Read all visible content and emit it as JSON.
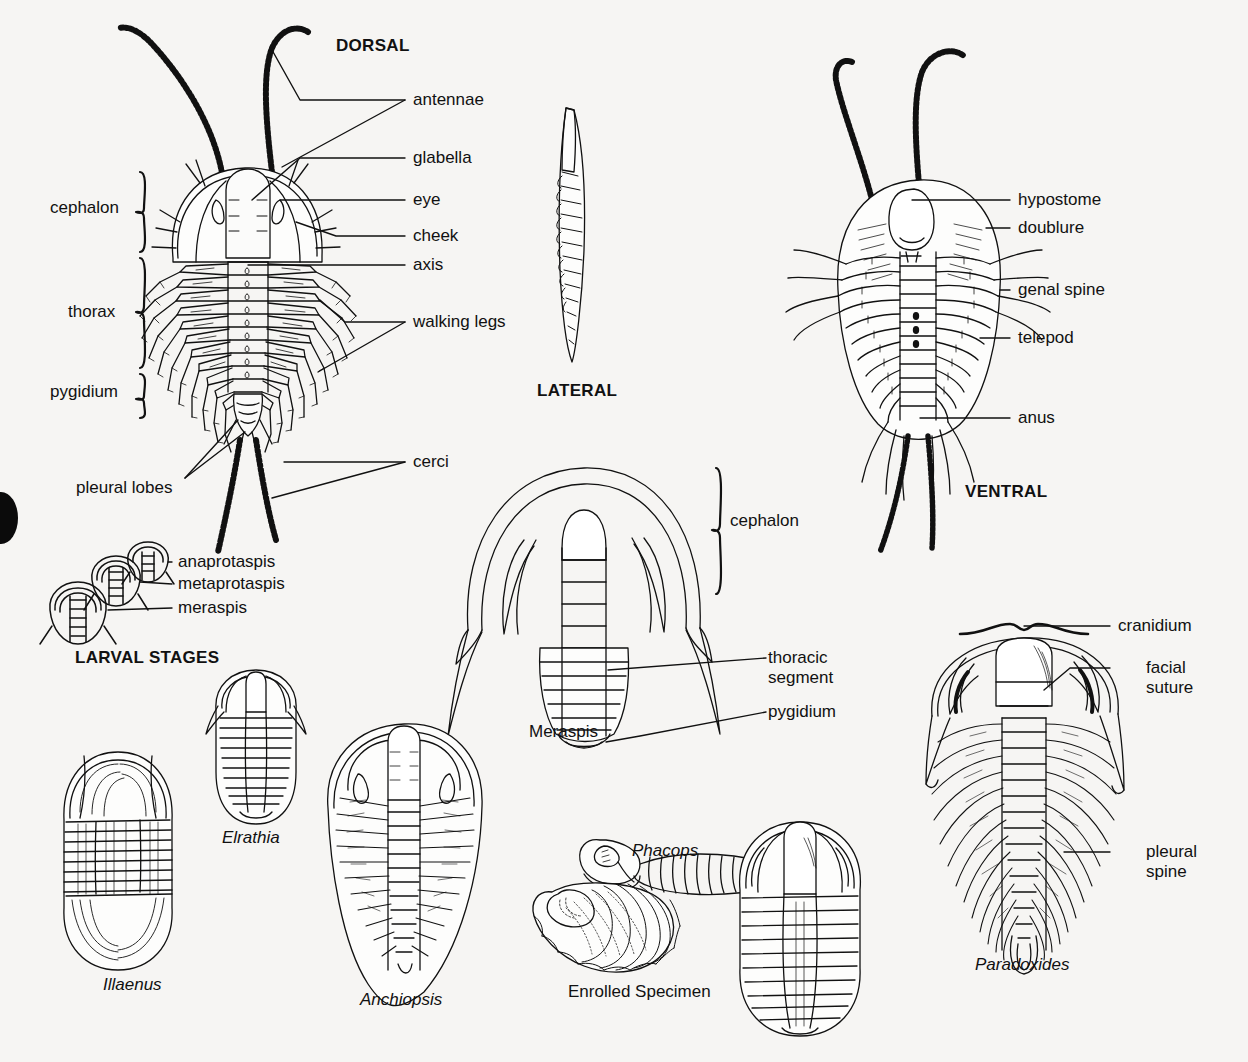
{
  "figure": {
    "background_color": "#f6f5f3",
    "ink_color": "#111111"
  },
  "section_titles": {
    "dorsal": "DORSAL",
    "lateral": "LATERAL",
    "ventral": "VENTRAL",
    "larval_stages": "LARVAL STAGES"
  },
  "dorsal_labels": {
    "antennae": "antennae",
    "glabella": "glabella",
    "eye": "eye",
    "cheek": "cheek",
    "axis": "axis",
    "walking_legs": "walking legs",
    "cerci": "cerci",
    "pleural_lobes": "pleural lobes",
    "cephalon": "cephalon",
    "thorax": "thorax",
    "pygidium": "pygidium"
  },
  "ventral_labels": {
    "hypostome": "hypostome",
    "doublure": "doublure",
    "genal_spine": "genal spine",
    "telepod": "telepod",
    "anus": "anus"
  },
  "larval_labels": {
    "anaprotaspis": "anaprotaspis",
    "metaprotaspis": "metaprotaspis",
    "meraspis": "meraspis"
  },
  "meraspis_diagram": {
    "caption": "Meraspis",
    "cephalon": "cephalon",
    "thoracic_segment_line1": "thoracic",
    "thoracic_segment_line2": "segment",
    "pygidium": "pygidium"
  },
  "paradoxides_diagram": {
    "caption": "Paradoxides",
    "cranidium": "cranidium",
    "facial_suture_line1": "facial",
    "facial_suture_line2": "suture",
    "pleural_spine_line1": "pleural",
    "pleural_spine_line2": "spine"
  },
  "specimens": [
    {
      "name": "Illaenus",
      "italic": true
    },
    {
      "name": "Elrathia",
      "italic": true
    },
    {
      "name": "Anchiopsis",
      "italic": true
    },
    {
      "name": "Phacops",
      "italic": true
    },
    {
      "name": "Enrolled Specimen",
      "italic": false
    }
  ]
}
